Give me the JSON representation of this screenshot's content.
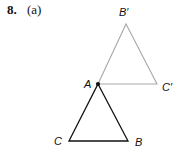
{
  "problem": {
    "number": "8.",
    "part": "(a)"
  },
  "figure": {
    "image_triangle": {
      "color": "#a8a8a8",
      "vertices": {
        "A": {
          "label": "A",
          "x": 98,
          "y": 84
        },
        "B_prime": {
          "label": "B′",
          "x": 126,
          "y": 24
        },
        "C_prime": {
          "label": "C′",
          "x": 157,
          "y": 84
        }
      }
    },
    "original_triangle": {
      "color": "#111111",
      "vertices": {
        "A": {
          "label": "A",
          "x": 98,
          "y": 84
        },
        "B": {
          "label": "B",
          "x": 128,
          "y": 141
        },
        "C": {
          "label": "C",
          "x": 69,
          "y": 141
        }
      }
    },
    "labels": {
      "A": "A",
      "B": "B",
      "C": "C",
      "B_prime": "B′",
      "C_prime": "C′"
    }
  }
}
